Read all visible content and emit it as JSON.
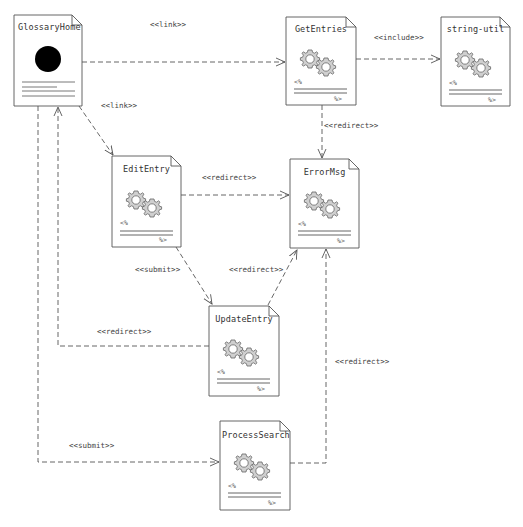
{
  "diagram": {
    "type": "uml-web-page-component-diagram",
    "colors": {
      "background": "#ffffff",
      "line": "#555555",
      "gear_fill": "#c8c8c8",
      "gear_stroke": "#666666",
      "server_page_icon": "#000000"
    },
    "nodes": [
      {
        "id": "GlossaryHome",
        "label": "GlossaryHome",
        "icon": "client-page-icon",
        "x": 14,
        "y": 15,
        "w": 68,
        "h": 91
      },
      {
        "id": "GetEntries",
        "label": "GetEntries",
        "icon": "gears-icon",
        "x": 286,
        "y": 17,
        "w": 70,
        "h": 88
      },
      {
        "id": "string-util",
        "label": "string-util",
        "icon": "gears-icon",
        "x": 441,
        "y": 17,
        "w": 69,
        "h": 89
      },
      {
        "id": "EditEntry",
        "label": "EditEntry",
        "icon": "gears-icon",
        "x": 112,
        "y": 156,
        "w": 69,
        "h": 91
      },
      {
        "id": "ErrorMsg",
        "label": "ErrorMsg",
        "icon": "gears-icon",
        "x": 290,
        "y": 159,
        "w": 69,
        "h": 89
      },
      {
        "id": "UpdateEntry",
        "label": "UpdateEntry",
        "icon": "gears-icon",
        "x": 209,
        "y": 306,
        "w": 70,
        "h": 90
      },
      {
        "id": "ProcessSearch",
        "label": "ProcessSearch",
        "icon": "gears-icon",
        "x": 220,
        "y": 421,
        "w": 70,
        "h": 89
      }
    ],
    "script_tags": {
      "open": "<%",
      "close": "%>"
    },
    "edges": [
      {
        "from": "GlossaryHome",
        "to": "GetEntries",
        "label": "<<link>>",
        "label_x": 150,
        "label_y": 20
      },
      {
        "from": "GetEntries",
        "to": "string-util",
        "label": "<<include>>",
        "label_x": 374,
        "label_y": 33
      },
      {
        "from": "GlossaryHome",
        "to": "EditEntry",
        "label": "<<link>>",
        "label_x": 101,
        "label_y": 101
      },
      {
        "from": "GetEntries",
        "to": "ErrorMsg",
        "label": "<<redirect>>",
        "label_x": 324,
        "label_y": 121
      },
      {
        "from": "EditEntry",
        "to": "ErrorMsg",
        "label": "<<redirect>>",
        "label_x": 202,
        "label_y": 173
      },
      {
        "from": "EditEntry",
        "to": "UpdateEntry",
        "label": "<<submit>>",
        "label_x": 135,
        "label_y": 265
      },
      {
        "from": "UpdateEntry",
        "to": "ErrorMsg",
        "label": "<<redirect>>",
        "label_x": 229,
        "label_y": 265
      },
      {
        "from": "UpdateEntry",
        "to": "GlossaryHome",
        "label": "<<redirect>>",
        "label_x": 97,
        "label_y": 327
      },
      {
        "from": "ProcessSearch",
        "to": "ErrorMsg",
        "label": "<<redirect>>",
        "label_x": 335,
        "label_y": 357
      },
      {
        "from": "GlossaryHome",
        "to": "ProcessSearch",
        "label": "<<submit>>",
        "label_x": 69,
        "label_y": 441
      }
    ]
  }
}
